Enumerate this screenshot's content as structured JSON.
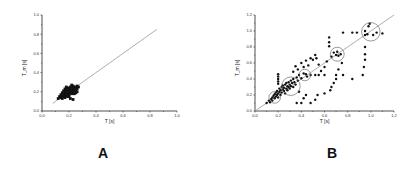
{
  "panels": {
    "A": {
      "label": "A"
    },
    "B": {
      "label": "B"
    }
  },
  "chart_data": [
    {
      "id": "A",
      "type": "scatter",
      "title": "",
      "panel_label": "A",
      "xlabel": "T [s]",
      "ylabel": "T_m [s]",
      "xlim": [
        0.0,
        1.0
      ],
      "ylim": [
        0.0,
        1.0
      ],
      "xticks": [
        "0.0",
        "0.2",
        "0.4",
        "0.6",
        "0.8",
        "1.0"
      ],
      "yticks": [
        "0.0",
        "0.2",
        "0.4",
        "0.6",
        "0.8",
        "1.0"
      ],
      "grid": false,
      "reference_line": {
        "type": "identity",
        "from": [
          0.08,
          0.08
        ],
        "to": [
          0.85,
          0.85
        ],
        "color": "#999999"
      },
      "series": [
        {
          "name": "data",
          "marker": "filled-square",
          "color": "#111111",
          "points": [
            [
              0.12,
              0.13
            ],
            [
              0.13,
              0.15
            ],
            [
              0.14,
              0.14
            ],
            [
              0.14,
              0.17
            ],
            [
              0.15,
              0.16
            ],
            [
              0.15,
              0.19
            ],
            [
              0.16,
              0.15
            ],
            [
              0.16,
              0.18
            ],
            [
              0.16,
              0.21
            ],
            [
              0.17,
              0.17
            ],
            [
              0.17,
              0.2
            ],
            [
              0.17,
              0.23
            ],
            [
              0.18,
              0.16
            ],
            [
              0.18,
              0.19
            ],
            [
              0.18,
              0.22
            ],
            [
              0.19,
              0.18
            ],
            [
              0.19,
              0.21
            ],
            [
              0.19,
              0.24
            ],
            [
              0.2,
              0.17
            ],
            [
              0.2,
              0.2
            ],
            [
              0.2,
              0.23
            ],
            [
              0.21,
              0.19
            ],
            [
              0.21,
              0.22
            ],
            [
              0.21,
              0.25
            ],
            [
              0.22,
              0.18
            ],
            [
              0.22,
              0.21
            ],
            [
              0.22,
              0.24
            ],
            [
              0.23,
              0.2
            ],
            [
              0.23,
              0.23
            ],
            [
              0.23,
              0.26
            ],
            [
              0.24,
              0.22
            ],
            [
              0.24,
              0.25
            ],
            [
              0.25,
              0.21
            ],
            [
              0.25,
              0.24
            ],
            [
              0.26,
              0.23
            ],
            [
              0.26,
              0.26
            ],
            [
              0.27,
              0.25
            ],
            [
              0.21,
              0.13
            ],
            [
              0.23,
              0.12
            ],
            [
              0.2,
              0.15
            ],
            [
              0.18,
              0.25
            ],
            [
              0.25,
              0.19
            ],
            [
              0.15,
              0.13
            ],
            [
              0.17,
              0.14
            ],
            [
              0.19,
              0.15
            ],
            [
              0.24,
              0.18
            ],
            [
              0.22,
              0.27
            ],
            [
              0.26,
              0.2
            ]
          ]
        }
      ]
    },
    {
      "id": "B",
      "type": "scatter",
      "title": "",
      "panel_label": "B",
      "xlabel": "T [s]",
      "ylabel": "T_m [s]",
      "xlim": [
        0.0,
        1.2
      ],
      "ylim": [
        0.0,
        1.2
      ],
      "xticks": [
        "0.0",
        "0.2",
        "0.4",
        "0.6",
        "0.8",
        "1.0",
        "1.2"
      ],
      "yticks": [
        "0.0",
        "0.2",
        "0.4",
        "0.6",
        "0.8",
        "1.0",
        "1.2"
      ],
      "grid": false,
      "reference_line": {
        "type": "identity",
        "from": [
          0.0,
          0.0
        ],
        "to": [
          1.2,
          1.2
        ],
        "color": "#999999"
      },
      "highlight_circles": [
        {
          "cx": 0.17,
          "cy": 0.17,
          "r": 0.05
        },
        {
          "cx": 0.31,
          "cy": 0.31,
          "r": 0.08
        },
        {
          "cx": 0.43,
          "cy": 0.45,
          "r": 0.05
        },
        {
          "cx": 0.71,
          "cy": 0.71,
          "r": 0.06
        },
        {
          "cx": 1.0,
          "cy": 0.99,
          "r": 0.08
        }
      ],
      "series": [
        {
          "name": "data",
          "marker": "filled-circle",
          "color": "#111111",
          "points": [
            [
              0.1,
              0.1
            ],
            [
              0.12,
              0.13
            ],
            [
              0.13,
              0.11
            ],
            [
              0.14,
              0.15
            ],
            [
              0.15,
              0.17
            ],
            [
              0.15,
              0.13
            ],
            [
              0.16,
              0.19
            ],
            [
              0.17,
              0.16
            ],
            [
              0.17,
              0.21
            ],
            [
              0.18,
              0.18
            ],
            [
              0.18,
              0.23
            ],
            [
              0.19,
              0.2
            ],
            [
              0.19,
              0.25
            ],
            [
              0.2,
              0.22
            ],
            [
              0.2,
              0.17
            ],
            [
              0.21,
              0.24
            ],
            [
              0.21,
              0.28
            ],
            [
              0.22,
              0.2
            ],
            [
              0.22,
              0.26
            ],
            [
              0.23,
              0.3
            ],
            [
              0.23,
              0.23
            ],
            [
              0.24,
              0.27
            ],
            [
              0.24,
              0.32
            ],
            [
              0.25,
              0.25
            ],
            [
              0.25,
              0.29
            ],
            [
              0.26,
              0.33
            ],
            [
              0.26,
              0.22
            ],
            [
              0.27,
              0.28
            ],
            [
              0.27,
              0.35
            ],
            [
              0.28,
              0.31
            ],
            [
              0.28,
              0.26
            ],
            [
              0.29,
              0.36
            ],
            [
              0.29,
              0.3
            ],
            [
              0.3,
              0.33
            ],
            [
              0.3,
              0.28
            ],
            [
              0.31,
              0.38
            ],
            [
              0.31,
              0.31
            ],
            [
              0.32,
              0.35
            ],
            [
              0.33,
              0.3
            ],
            [
              0.33,
              0.4
            ],
            [
              0.34,
              0.36
            ],
            [
              0.35,
              0.33
            ],
            [
              0.36,
              0.42
            ],
            [
              0.37,
              0.38
            ],
            [
              0.38,
              0.45
            ],
            [
              0.4,
              0.41
            ],
            [
              0.42,
              0.47
            ],
            [
              0.44,
              0.46
            ],
            [
              0.45,
              0.43
            ],
            [
              0.2,
              0.4
            ],
            [
              0.2,
              0.43
            ],
            [
              0.2,
              0.46
            ],
            [
              0.2,
              0.37
            ],
            [
              0.2,
              0.34
            ],
            [
              0.33,
              0.49
            ],
            [
              0.35,
              0.56
            ],
            [
              0.37,
              0.52
            ],
            [
              0.4,
              0.6
            ],
            [
              0.42,
              0.55
            ],
            [
              0.44,
              0.63
            ],
            [
              0.46,
              0.57
            ],
            [
              0.48,
              0.66
            ],
            [
              0.5,
              0.64
            ],
            [
              0.52,
              0.7
            ],
            [
              0.53,
              0.66
            ],
            [
              0.55,
              0.58
            ],
            [
              0.57,
              0.5
            ],
            [
              0.6,
              0.55
            ],
            [
              0.62,
              0.62
            ],
            [
              0.66,
              0.68
            ],
            [
              0.68,
              0.73
            ],
            [
              0.7,
              0.7
            ],
            [
              0.71,
              0.74
            ],
            [
              0.72,
              0.69
            ],
            [
              0.74,
              0.71
            ],
            [
              0.64,
              0.92
            ],
            [
              0.64,
              0.86
            ],
            [
              0.64,
              0.81
            ],
            [
              0.76,
              0.98
            ],
            [
              0.84,
              0.98
            ],
            [
              0.88,
              0.98
            ],
            [
              0.95,
              1.0
            ],
            [
              0.97,
              0.96
            ],
            [
              0.98,
              1.06
            ],
            [
              0.99,
              1.09
            ],
            [
              1.02,
              0.95
            ],
            [
              1.05,
              0.98
            ],
            [
              1.1,
              0.97
            ],
            [
              0.95,
              0.95
            ],
            [
              0.95,
              0.8
            ],
            [
              0.95,
              0.71
            ],
            [
              0.95,
              0.64
            ],
            [
              0.94,
              0.55
            ],
            [
              0.93,
              0.45
            ],
            [
              0.75,
              0.6
            ],
            [
              0.72,
              0.52
            ],
            [
              0.7,
              0.45
            ],
            [
              0.7,
              0.4
            ],
            [
              0.68,
              0.35
            ],
            [
              0.66,
              0.3
            ],
            [
              0.55,
              0.45
            ],
            [
              0.52,
              0.45
            ],
            [
              0.48,
              0.45
            ],
            [
              0.6,
              0.45
            ],
            [
              0.84,
              0.4
            ],
            [
              0.76,
              0.45
            ],
            [
              0.36,
              0.1
            ],
            [
              0.4,
              0.1
            ],
            [
              0.48,
              0.1
            ],
            [
              0.42,
              0.16
            ],
            [
              0.52,
              0.14
            ],
            [
              0.54,
              0.2
            ],
            [
              0.6,
              0.22
            ],
            [
              0.65,
              0.26
            ],
            [
              0.44,
              0.2
            ],
            [
              0.38,
              0.24
            ]
          ]
        }
      ]
    }
  ]
}
